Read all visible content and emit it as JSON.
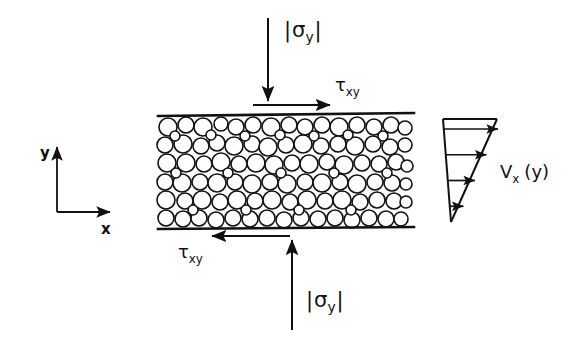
{
  "figure": {
    "background_color": "#ffffff",
    "ink_color": "#111111"
  },
  "labels": {
    "normal_stress_top": {
      "bar_left": "|",
      "symbol": "σ",
      "subscript": "y",
      "bar_right": "|",
      "full_text": "|σy|"
    },
    "normal_stress_bottom": {
      "bar_left": "|",
      "symbol": "σ",
      "subscript": "y",
      "bar_right": "|",
      "full_text": "|σy|"
    },
    "shear_stress_top": {
      "symbol": "τ",
      "subscript": "xy",
      "full_text": "τxy"
    },
    "shear_stress_bottom": {
      "symbol": "τ",
      "subscript": "xy",
      "full_text": "τxy"
    },
    "axis_y": "y",
    "axis_x": "x",
    "velocity_profile": {
      "symbol": "V",
      "subscript": "x",
      "argument": "(y)",
      "full_text": "Vx (y)"
    }
  },
  "chart_data": {
    "type": "line",
    "xlabel": "Vx (y)",
    "ylabel": "y",
    "grid": false,
    "legend": "none",
    "profile_arrows": [
      {
        "index": 1,
        "relative_height": 1.0,
        "relative_velocity": 1.0
      },
      {
        "index": 2,
        "relative_height": 0.75,
        "relative_velocity": 0.75
      },
      {
        "index": 3,
        "relative_height": 0.5,
        "relative_velocity": 0.5
      },
      {
        "index": 4,
        "relative_height": 0.25,
        "relative_velocity": 0.25
      },
      {
        "index": 5,
        "relative_height": 0.0,
        "relative_velocity": 0.0
      }
    ],
    "xlim": [
      0,
      1
    ],
    "ylim": [
      0,
      1
    ]
  },
  "geometry": {
    "cell": {
      "left": 158,
      "right": 412,
      "top": 116,
      "bottom": 229
    },
    "plate_line_width": 2.5,
    "particle_outline_width": 1.6,
    "particle_fill": "#ffffff",
    "particle_stroke": "#111111"
  },
  "particles": [
    {
      "cx": 168,
      "cy": 127,
      "r": 9
    },
    {
      "cx": 186,
      "cy": 125,
      "r": 8
    },
    {
      "cx": 203,
      "cy": 127,
      "r": 9
    },
    {
      "cx": 221,
      "cy": 124,
      "r": 7
    },
    {
      "cx": 236,
      "cy": 127,
      "r": 8
    },
    {
      "cx": 253,
      "cy": 125,
      "r": 8
    },
    {
      "cx": 271,
      "cy": 127,
      "r": 9
    },
    {
      "cx": 289,
      "cy": 125,
      "r": 8
    },
    {
      "cx": 305,
      "cy": 127,
      "r": 8
    },
    {
      "cx": 322,
      "cy": 125,
      "r": 8
    },
    {
      "cx": 339,
      "cy": 127,
      "r": 9
    },
    {
      "cx": 357,
      "cy": 125,
      "r": 8
    },
    {
      "cx": 374,
      "cy": 127,
      "r": 8
    },
    {
      "cx": 391,
      "cy": 125,
      "r": 8
    },
    {
      "cx": 405,
      "cy": 128,
      "r": 7
    },
    {
      "cx": 165,
      "cy": 145,
      "r": 8
    },
    {
      "cx": 183,
      "cy": 144,
      "r": 9
    },
    {
      "cx": 201,
      "cy": 146,
      "r": 8
    },
    {
      "cx": 217,
      "cy": 143,
      "r": 8
    },
    {
      "cx": 234,
      "cy": 146,
      "r": 9
    },
    {
      "cx": 252,
      "cy": 144,
      "r": 8
    },
    {
      "cx": 268,
      "cy": 147,
      "r": 9
    },
    {
      "cx": 286,
      "cy": 145,
      "r": 8
    },
    {
      "cx": 303,
      "cy": 144,
      "r": 9
    },
    {
      "cx": 321,
      "cy": 146,
      "r": 8
    },
    {
      "cx": 338,
      "cy": 144,
      "r": 8
    },
    {
      "cx": 355,
      "cy": 146,
      "r": 9
    },
    {
      "cx": 373,
      "cy": 144,
      "r": 8
    },
    {
      "cx": 390,
      "cy": 147,
      "r": 8
    },
    {
      "cx": 405,
      "cy": 145,
      "r": 7
    },
    {
      "cx": 167,
      "cy": 163,
      "r": 9
    },
    {
      "cx": 186,
      "cy": 163,
      "r": 9
    },
    {
      "cx": 204,
      "cy": 164,
      "r": 8
    },
    {
      "cx": 221,
      "cy": 162,
      "r": 9
    },
    {
      "cx": 239,
      "cy": 164,
      "r": 8
    },
    {
      "cx": 256,
      "cy": 163,
      "r": 9
    },
    {
      "cx": 274,
      "cy": 165,
      "r": 9
    },
    {
      "cx": 292,
      "cy": 163,
      "r": 8
    },
    {
      "cx": 309,
      "cy": 164,
      "r": 9
    },
    {
      "cx": 327,
      "cy": 162,
      "r": 8
    },
    {
      "cx": 344,
      "cy": 165,
      "r": 9
    },
    {
      "cx": 362,
      "cy": 163,
      "r": 8
    },
    {
      "cx": 379,
      "cy": 164,
      "r": 8
    },
    {
      "cx": 396,
      "cy": 162,
      "r": 8
    },
    {
      "cx": 407,
      "cy": 166,
      "r": 6
    },
    {
      "cx": 165,
      "cy": 182,
      "r": 8
    },
    {
      "cx": 182,
      "cy": 183,
      "r": 9
    },
    {
      "cx": 200,
      "cy": 182,
      "r": 8
    },
    {
      "cx": 217,
      "cy": 183,
      "r": 9
    },
    {
      "cx": 235,
      "cy": 182,
      "r": 8
    },
    {
      "cx": 252,
      "cy": 184,
      "r": 9
    },
    {
      "cx": 270,
      "cy": 182,
      "r": 8
    },
    {
      "cx": 287,
      "cy": 184,
      "r": 9
    },
    {
      "cx": 305,
      "cy": 182,
      "r": 8
    },
    {
      "cx": 322,
      "cy": 183,
      "r": 9
    },
    {
      "cx": 340,
      "cy": 182,
      "r": 8
    },
    {
      "cx": 357,
      "cy": 184,
      "r": 9
    },
    {
      "cx": 375,
      "cy": 182,
      "r": 8
    },
    {
      "cx": 392,
      "cy": 183,
      "r": 8
    },
    {
      "cx": 406,
      "cy": 184,
      "r": 6
    },
    {
      "cx": 166,
      "cy": 200,
      "r": 9
    },
    {
      "cx": 185,
      "cy": 201,
      "r": 8
    },
    {
      "cx": 202,
      "cy": 200,
      "r": 9
    },
    {
      "cx": 220,
      "cy": 202,
      "r": 8
    },
    {
      "cx": 237,
      "cy": 200,
      "r": 9
    },
    {
      "cx": 255,
      "cy": 201,
      "r": 8
    },
    {
      "cx": 272,
      "cy": 200,
      "r": 9
    },
    {
      "cx": 290,
      "cy": 202,
      "r": 8
    },
    {
      "cx": 307,
      "cy": 200,
      "r": 9
    },
    {
      "cx": 325,
      "cy": 201,
      "r": 8
    },
    {
      "cx": 342,
      "cy": 200,
      "r": 9
    },
    {
      "cx": 360,
      "cy": 202,
      "r": 8
    },
    {
      "cx": 377,
      "cy": 200,
      "r": 8
    },
    {
      "cx": 394,
      "cy": 201,
      "r": 8
    },
    {
      "cx": 406,
      "cy": 202,
      "r": 6
    },
    {
      "cx": 166,
      "cy": 218,
      "r": 8
    },
    {
      "cx": 183,
      "cy": 219,
      "r": 8
    },
    {
      "cx": 199,
      "cy": 218,
      "r": 8
    },
    {
      "cx": 216,
      "cy": 220,
      "r": 8
    },
    {
      "cx": 233,
      "cy": 218,
      "r": 8
    },
    {
      "cx": 250,
      "cy": 219,
      "r": 8
    },
    {
      "cx": 267,
      "cy": 218,
      "r": 8
    },
    {
      "cx": 284,
      "cy": 220,
      "r": 8
    },
    {
      "cx": 301,
      "cy": 218,
      "r": 8
    },
    {
      "cx": 318,
      "cy": 219,
      "r": 8
    },
    {
      "cx": 335,
      "cy": 218,
      "r": 8
    },
    {
      "cx": 352,
      "cy": 220,
      "r": 8
    },
    {
      "cx": 369,
      "cy": 218,
      "r": 8
    },
    {
      "cx": 386,
      "cy": 219,
      "r": 8
    },
    {
      "cx": 401,
      "cy": 219,
      "r": 7
    },
    {
      "cx": 175,
      "cy": 136,
      "r": 5
    },
    {
      "cx": 211,
      "cy": 135,
      "r": 5
    },
    {
      "cx": 245,
      "cy": 136,
      "r": 5
    },
    {
      "cx": 280,
      "cy": 135,
      "r": 5
    },
    {
      "cx": 314,
      "cy": 136,
      "r": 5
    },
    {
      "cx": 348,
      "cy": 135,
      "r": 5
    },
    {
      "cx": 383,
      "cy": 136,
      "r": 5
    },
    {
      "cx": 176,
      "cy": 173,
      "r": 5
    },
    {
      "cx": 228,
      "cy": 173,
      "r": 5
    },
    {
      "cx": 281,
      "cy": 173,
      "r": 5
    },
    {
      "cx": 334,
      "cy": 173,
      "r": 5
    },
    {
      "cx": 387,
      "cy": 173,
      "r": 5
    },
    {
      "cx": 193,
      "cy": 210,
      "r": 5
    },
    {
      "cx": 246,
      "cy": 210,
      "r": 5
    },
    {
      "cx": 299,
      "cy": 210,
      "r": 5
    },
    {
      "cx": 351,
      "cy": 210,
      "r": 5
    }
  ]
}
